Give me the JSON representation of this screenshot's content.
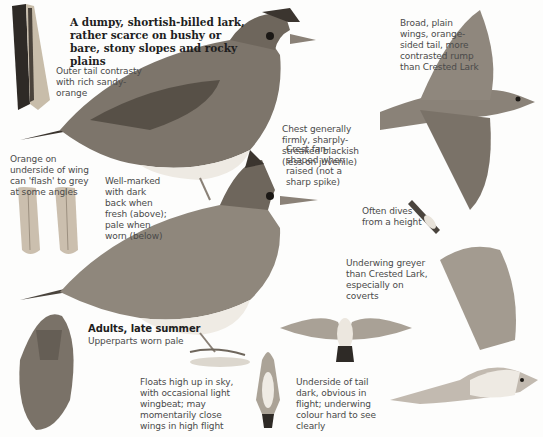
{
  "plate": {
    "title": "A dumpy, shortish-billed lark, rather scarce on bushy or bare, stony slopes and rocky plains",
    "annotations": {
      "outer_tail": "Outer tail contrasty with rich sandy-orange",
      "broad_wings": "Broad, plain wings, orange-sided tail, more contrasted rump than Crested Lark",
      "chest": "Chest generally firmly, sharply-streaked blackish (less on juvenile)",
      "orange_underside": "Orange on underside of wing can 'flash' to grey at some angles",
      "well_marked": "Well-marked with dark back when fresh (above); pale when worn (below)",
      "crest": "Crest fan-shaped when raised (not a sharp spike)",
      "dives": "Often dives from a height",
      "underwing": "Underwing greyer than Crested Lark, especially on coverts",
      "adults_heading": "Adults, late summer",
      "adults_sub": "Upperparts worn pale",
      "floats": "Floats high up in sky, with occasional light wingbeat; may momentarily close wings in high flight",
      "underside_tail": "Underside of tail dark, obvious in flight; underwing colour hard to see clearly"
    },
    "colors": {
      "background": "#fdfdfc",
      "text": "#4a4a4a",
      "title": "#1e1e1e",
      "bird_dark": "#3b352f",
      "bird_mid": "#7d756b",
      "bird_light": "#c9c2b6",
      "bird_belly": "#eeeae3"
    }
  }
}
